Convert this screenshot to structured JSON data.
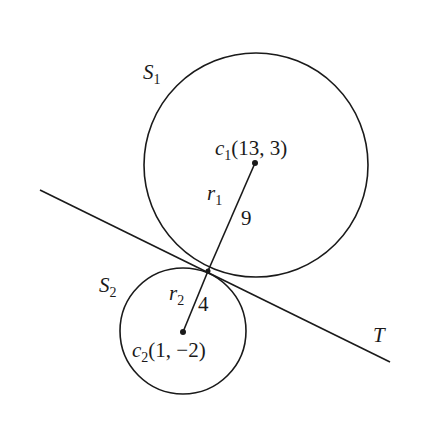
{
  "diagram": {
    "circles": [
      {
        "id": "S1",
        "label": "S",
        "label_sub": "1",
        "center_label": "c",
        "center_sub": "1",
        "center_coords": "(13, 3)",
        "radius_label": "r",
        "radius_sub": "1",
        "radius_value": "9"
      },
      {
        "id": "S2",
        "label": "S",
        "label_sub": "2",
        "center_label": "c",
        "center_sub": "2",
        "center_coords": "(1, −2)",
        "radius_label": "r",
        "radius_sub": "2",
        "radius_value": "4"
      }
    ],
    "tangent_line": {
      "label": "T"
    },
    "colors": {
      "stroke": "#1a1a1a",
      "background": "#ffffff"
    }
  }
}
